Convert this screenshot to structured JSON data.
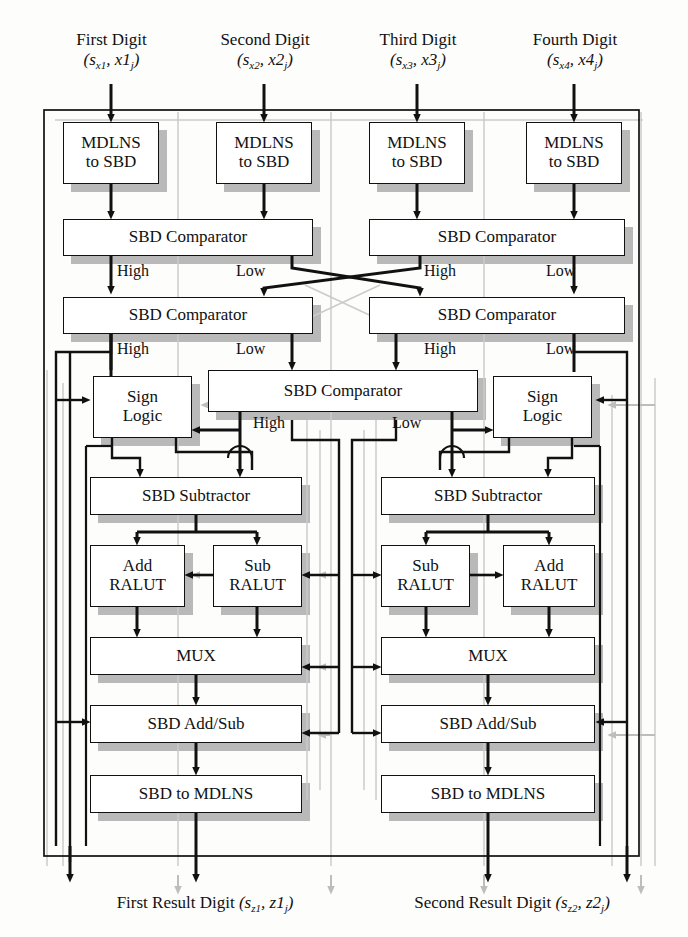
{
  "diagram": {
    "colors": {
      "line": "#111111",
      "shadow": "#b9b9b9",
      "ghost": "#c9c9c9",
      "box_fill": "#ffffff",
      "background": "#fdfdfc"
    },
    "inputs": [
      {
        "name": "first-digit",
        "title": "First Digit",
        "sub": "(s",
        "sub_i1": "x1",
        "mid": ", x1",
        "sub_i2": "j",
        "close": ")"
      },
      {
        "name": "second-digit",
        "title": "Second Digit",
        "sub": "(s",
        "sub_i1": "x2",
        "mid": ", x2",
        "sub_i2": "j",
        "close": ")"
      },
      {
        "name": "third-digit",
        "title": "Third Digit",
        "sub": "(s",
        "sub_i1": "x3",
        "mid": ", x3",
        "sub_i2": "j",
        "close": ")"
      },
      {
        "name": "fourth-digit",
        "title": "Fourth Digit",
        "sub": "(s",
        "sub_i1": "x4",
        "mid": ", x4",
        "sub_i2": "j",
        "close": ")"
      }
    ],
    "outputs": [
      {
        "name": "first-result-digit",
        "title": "First Result Digit",
        "open": "(s",
        "sub_i1": "z1",
        "mid": ", z1",
        "sub_i2": "j",
        "close": ")"
      },
      {
        "name": "second-result-digit",
        "title": "Second Result Digit",
        "open": "(s",
        "sub_i1": "z2",
        "mid": ", z2",
        "sub_i2": "j",
        "close": ")"
      }
    ],
    "blocks": [
      {
        "id": "mdlns-to-sbd-1",
        "line1": "MDLNS",
        "line2": "to SBD",
        "x": 63,
        "y": 122,
        "w": 96,
        "h": 62
      },
      {
        "id": "mdlns-to-sbd-2",
        "line1": "MDLNS",
        "line2": "to SBD",
        "x": 216,
        "y": 122,
        "w": 96,
        "h": 62
      },
      {
        "id": "mdlns-to-sbd-3",
        "line1": "MDLNS",
        "line2": "to SBD",
        "x": 369,
        "y": 122,
        "w": 96,
        "h": 62
      },
      {
        "id": "mdlns-to-sbd-4",
        "line1": "MDLNS",
        "line2": "to SBD",
        "x": 526,
        "y": 122,
        "w": 96,
        "h": 62
      },
      {
        "id": "sbd-comparator-a1",
        "line1": "SBD Comparator",
        "x": 63,
        "y": 219,
        "w": 250,
        "h": 37
      },
      {
        "id": "sbd-comparator-a2",
        "line1": "SBD Comparator",
        "x": 369,
        "y": 219,
        "w": 256,
        "h": 37
      },
      {
        "id": "sbd-comparator-b1",
        "line1": "SBD Comparator",
        "x": 63,
        "y": 297,
        "w": 250,
        "h": 37
      },
      {
        "id": "sbd-comparator-b2",
        "line1": "SBD Comparator",
        "x": 369,
        "y": 297,
        "w": 256,
        "h": 37
      },
      {
        "id": "sign-logic-left",
        "line1": "Sign",
        "line2": "Logic",
        "x": 93,
        "y": 376,
        "w": 99,
        "h": 62
      },
      {
        "id": "sbd-comparator-c",
        "line1": "SBD Comparator",
        "x": 208,
        "y": 370,
        "w": 270,
        "h": 42
      },
      {
        "id": "sign-logic-right",
        "line1": "Sign",
        "line2": "Logic",
        "x": 493,
        "y": 376,
        "w": 99,
        "h": 62
      },
      {
        "id": "sbd-subtractor-left",
        "line1": "SBD Subtractor",
        "x": 90,
        "y": 477,
        "w": 212,
        "h": 38
      },
      {
        "id": "sbd-subtractor-right",
        "line1": "SBD Subtractor",
        "x": 381,
        "y": 477,
        "w": 214,
        "h": 38
      },
      {
        "id": "add-ralut-left",
        "line1": "Add",
        "line2": "RALUT",
        "x": 90,
        "y": 545,
        "w": 95,
        "h": 62
      },
      {
        "id": "sub-ralut-left",
        "line1": "Sub",
        "line2": "RALUT",
        "x": 213,
        "y": 545,
        "w": 89,
        "h": 62
      },
      {
        "id": "sub-ralut-right",
        "line1": "Sub",
        "line2": "RALUT",
        "x": 381,
        "y": 545,
        "w": 89,
        "h": 62
      },
      {
        "id": "add-ralut-right",
        "line1": "Add",
        "line2": "RALUT",
        "x": 503,
        "y": 545,
        "w": 92,
        "h": 62
      },
      {
        "id": "mux-left",
        "line1": "MUX",
        "x": 90,
        "y": 637,
        "w": 212,
        "h": 38
      },
      {
        "id": "mux-right",
        "line1": "MUX",
        "x": 381,
        "y": 637,
        "w": 214,
        "h": 38
      },
      {
        "id": "sbd-add-sub-left",
        "line1": "SBD Add/Sub",
        "x": 90,
        "y": 705,
        "w": 212,
        "h": 38
      },
      {
        "id": "sbd-add-sub-right",
        "line1": "SBD Add/Sub",
        "x": 381,
        "y": 705,
        "w": 214,
        "h": 38
      },
      {
        "id": "sbd-to-mdlns-left",
        "line1": "SBD to MDLNS",
        "x": 90,
        "y": 775,
        "w": 212,
        "h": 38
      },
      {
        "id": "sbd-to-mdlns-right",
        "line1": "SBD to MDLNS",
        "x": 381,
        "y": 775,
        "w": 214,
        "h": 38
      }
    ],
    "signal_labels": [
      {
        "id": "high-a1",
        "text": "High",
        "x": 117,
        "y": 262
      },
      {
        "id": "low-a1",
        "text": "Low",
        "x": 236,
        "y": 262
      },
      {
        "id": "high-a2",
        "text": "High",
        "x": 424,
        "y": 262
      },
      {
        "id": "low-a2",
        "text": "Low",
        "x": 546,
        "y": 262
      },
      {
        "id": "high-b1",
        "text": "High",
        "x": 117,
        "y": 340
      },
      {
        "id": "low-b1",
        "text": "Low",
        "x": 236,
        "y": 340
      },
      {
        "id": "high-b2",
        "text": "High",
        "x": 424,
        "y": 340
      },
      {
        "id": "low-b2",
        "text": "Low",
        "x": 546,
        "y": 340
      },
      {
        "id": "high-c",
        "text": "High",
        "x": 253,
        "y": 414
      },
      {
        "id": "low-c",
        "text": "Low",
        "x": 392,
        "y": 414
      }
    ]
  }
}
